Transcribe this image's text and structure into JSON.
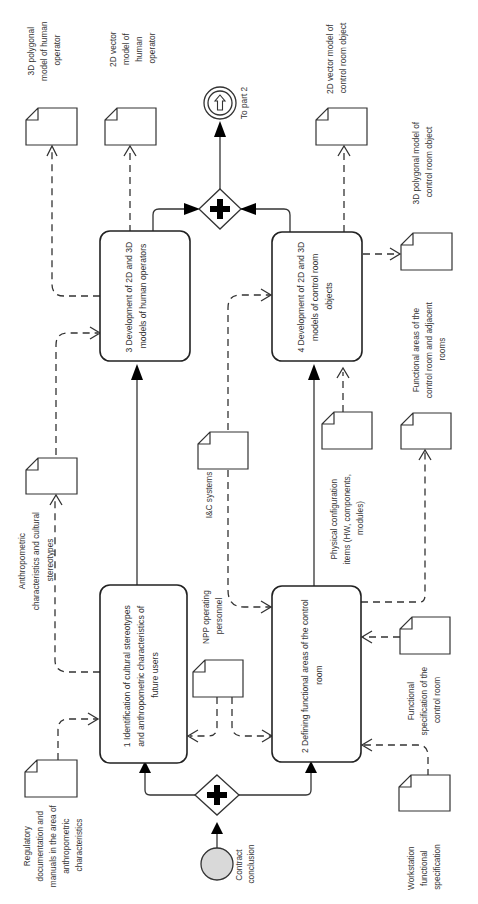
{
  "diagram": {
    "type": "BPMN process diagram (rotated 90°)",
    "tasks": [
      {
        "id": "task1",
        "lines": [
          "1 Identification of cultural stereotypes",
          "and anthropometric characteristics of",
          "future users"
        ]
      },
      {
        "id": "task2",
        "lines": [
          "2 Defining functional areas of the control",
          "room"
        ]
      },
      {
        "id": "task3",
        "lines": [
          "3 Development of 2D and 3D",
          "models of human operators"
        ]
      },
      {
        "id": "task4",
        "lines": [
          "4 Development of 2D and 3D",
          "models of control room",
          "objects"
        ]
      }
    ],
    "events": {
      "start": {
        "label_lines": [
          "Contract",
          "conclusion"
        ]
      },
      "end": {
        "label": "To part 2"
      }
    },
    "gateways": [
      {
        "id": "split",
        "type": "parallel",
        "symbol": "+"
      },
      {
        "id": "join",
        "type": "parallel",
        "symbol": "+"
      }
    ],
    "documents": [
      {
        "id": "reg",
        "lines": [
          "Regulatory",
          "documentation and",
          "manuals in the area of",
          "anthropometric",
          "characteristics"
        ]
      },
      {
        "id": "anthro",
        "lines": [
          "Anthropometric",
          "characteristics and cultural",
          "stereotypes"
        ]
      },
      {
        "id": "hum3d",
        "lines": [
          "3D polygonal",
          "model of human",
          "operator"
        ]
      },
      {
        "id": "hum2d",
        "lines": [
          "2D vector",
          "model of",
          "human",
          "operator"
        ]
      },
      {
        "id": "npp",
        "lines": [
          "NPP operating",
          "personnel"
        ]
      },
      {
        "id": "ic",
        "lines": [
          "I&C systems"
        ]
      },
      {
        "id": "phys",
        "lines": [
          "Physical configuration",
          "items (HW, components,",
          "modules)"
        ]
      },
      {
        "id": "cr2d",
        "lines": [
          "2D vector model of",
          "control room object"
        ]
      },
      {
        "id": "cr3d",
        "lines": [
          "3D polygonal model of",
          "control room object"
        ]
      },
      {
        "id": "areas",
        "lines": [
          "Functional areas of the",
          "control room and adjacent",
          "rooms"
        ]
      },
      {
        "id": "funcspec",
        "lines": [
          "Functional",
          "specification of the",
          "control room"
        ]
      },
      {
        "id": "wsspec",
        "lines": [
          "Workstation",
          "functional",
          "specification"
        ]
      }
    ],
    "colors": {
      "stroke": "#222222",
      "start_event_fill": "#d9d9d9",
      "background": "#ffffff"
    }
  }
}
